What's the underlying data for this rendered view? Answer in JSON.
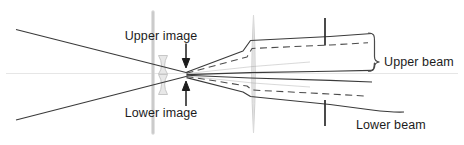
{
  "figure": {
    "kind": "optical-ray-diagram",
    "width": 464,
    "height": 145,
    "background": "#ffffff"
  },
  "colors": {
    "ray_stroke": "#3a3a3a",
    "ray_stroke_light": "#5a5a5a",
    "dashed_stroke": "#4a4a4a",
    "optic_gray": "#c9c9c9",
    "optic_gray_light": "#dcdcdc",
    "axis_gray": "#e2e2e2",
    "tick_black": "#2b2b2b",
    "brace_stroke": "#4a4a4a",
    "text": "#1c1c1c"
  },
  "labels": {
    "upper_image": "Upper image",
    "lower_image": "Lower image",
    "upper_beam": "Upper beam",
    "lower_beam": "Lower beam"
  },
  "annotations": {
    "upper_image_arrow": "arrow-down-icon",
    "lower_image_arrow": "arrow-up-icon",
    "upper_beam_brace": "curly-brace-right-icon"
  },
  "elements": {
    "aperture_plane": "vertical-aperture-plane",
    "lens_small": "small-biconcave-lens",
    "lens_large": "large-lens-profile",
    "tick_upper": "upper-beam-tick-mark",
    "tick_lower": "lower-beam-tick-mark",
    "optical_axis": "optical-axis-line"
  }
}
